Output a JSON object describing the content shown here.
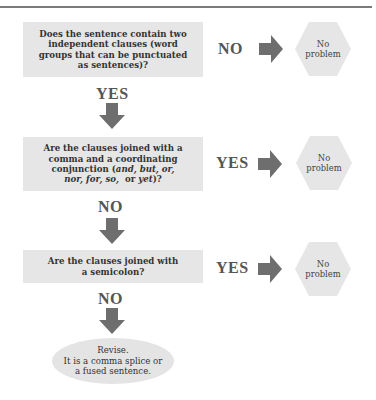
{
  "diagram": {
    "type": "flowchart",
    "colors": {
      "box_fill": "#e6e6e6",
      "arrow": "#6e6e6e",
      "label": "#555555",
      "rule": "#7a7a7a"
    },
    "steps": [
      {
        "question_lines": [
          "Does the sentence contain two",
          "independent clauses (word",
          "groups that can be punctuated",
          "as sentences)?"
        ],
        "side_label": "NO",
        "side_result_lines": [
          "No",
          "problem"
        ],
        "down_label": "YES"
      },
      {
        "question_lines": [
          "Are the clauses joined with a",
          "comma and a coordinating"
        ],
        "question_italic_line_1_prefix": "conjunction (",
        "question_italic_line_1_italic": "and, but, or,",
        "question_italic_line_2_italic": "nor, for, so,",
        "question_italic_line_2_mid": "  or ",
        "question_italic_line_2_italic2": "yet",
        "question_italic_line_2_suffix": ")?",
        "side_label": "YES",
        "side_result_lines": [
          "No",
          "problem"
        ],
        "down_label": "NO"
      },
      {
        "question_lines": [
          "Are the clauses joined with",
          "a semicolon?"
        ],
        "side_label": "YES",
        "side_result_lines": [
          "No",
          "problem"
        ],
        "down_label": "NO"
      }
    ],
    "final": {
      "lines": [
        "Revise.",
        "It is a comma splice or",
        "a fused sentence."
      ]
    }
  }
}
